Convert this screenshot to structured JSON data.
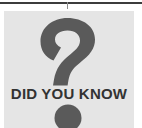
{
  "canvas": {
    "width": 142,
    "height": 128,
    "background_color": "#ffffff"
  },
  "top_rule": {
    "color": "#3c3c3c",
    "tick_color": "#8c8c8c"
  },
  "callout": {
    "panel_color": "#e5e5e5",
    "graphic_color": "#5a5a5a",
    "heading": "DID YOU KNOW",
    "heading_color": "#333333",
    "icon": "question-mark"
  }
}
